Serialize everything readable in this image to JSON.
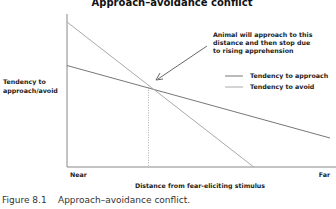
{
  "chart_data": {
    "type": "line",
    "title": "Approach–avoidance conflict",
    "xlabel": "Distance from fear-eliciting stimulus",
    "ylabel": "Tendency to approach/avoid",
    "ylabel_lines": [
      "Tendency to",
      "approach/avoid"
    ],
    "x_tick_labels": [
      "Near",
      "Far"
    ],
    "xlim": [
      0,
      1
    ],
    "ylim": [
      0,
      1
    ],
    "grid": false,
    "legend_position": "right",
    "series": [
      {
        "name": "Tendency to approach",
        "color": "#777777",
        "x": [
          0,
          1
        ],
        "y": [
          0.7,
          0.2
        ]
      },
      {
        "name": "Tendency to avoid",
        "color": "#aaaaaa",
        "x": [
          0,
          0.71
        ],
        "y": [
          1.0,
          0.0
        ]
      }
    ],
    "intersection": {
      "x": 0.31,
      "y": 0.55
    },
    "annotation": {
      "lines": [
        "Animal will approach to this",
        "distance and then stop due",
        "to rising apprehension"
      ]
    }
  },
  "caption": {
    "number": "Figure 8.1",
    "text": "Approach–avoidance conflict."
  }
}
